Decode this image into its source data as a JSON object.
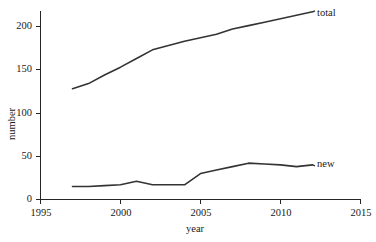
{
  "chart_data": {
    "type": "line",
    "title": "",
    "xlabel": "year",
    "ylabel": "number",
    "xlim": [
      1995,
      2015
    ],
    "ylim": [
      0,
      215
    ],
    "xticks": [
      1995,
      2000,
      2005,
      2010,
      2015
    ],
    "yticks": [
      0,
      50,
      100,
      150,
      200
    ],
    "grid": false,
    "legend_position": "inline-right-of-line-end",
    "x": [
      1997,
      1998,
      1999,
      2000,
      2001,
      2002,
      2003,
      2004,
      2005,
      2006,
      2007,
      2008,
      2009,
      2010,
      2011,
      2012
    ],
    "series": [
      {
        "name": "total",
        "label": "total",
        "color": "#333333",
        "values": [
          128,
          134,
          144,
          153,
          163,
          173,
          178,
          183,
          187,
          191,
          197,
          201,
          205,
          209,
          213,
          217
        ]
      },
      {
        "name": "new",
        "label": "new",
        "color": "#333333",
        "values": [
          15,
          15,
          16,
          17,
          21,
          17,
          17,
          17,
          30,
          34,
          38,
          42,
          41,
          40,
          38,
          40
        ]
      }
    ]
  },
  "axis": {
    "x_tick_labels": [
      "1995",
      "2000",
      "2005",
      "2010",
      "2015"
    ],
    "y_tick_labels": [
      "0",
      "50",
      "100",
      "150",
      "200"
    ],
    "x_title": "year",
    "y_title": "number"
  },
  "series_labels": {
    "total": "total",
    "new": "new"
  },
  "colors": {
    "line": "#333333",
    "axis": "#262626",
    "background": "#ffffff"
  }
}
